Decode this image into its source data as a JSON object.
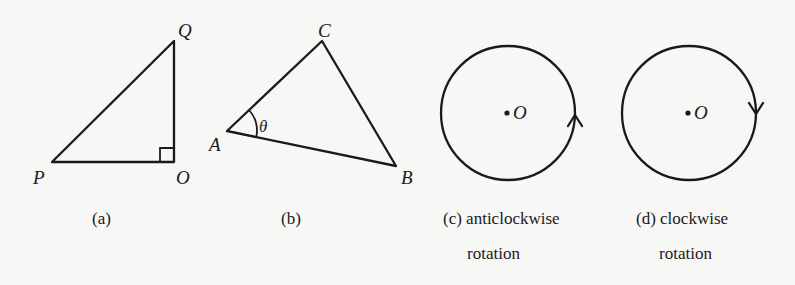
{
  "figure": {
    "panels": [
      {
        "id": "a",
        "caption": "(a)",
        "shape": "right-triangle",
        "vertices": {
          "P": "P",
          "O": "O",
          "Q": "Q"
        },
        "right_angle_at": "O"
      },
      {
        "id": "b",
        "caption": "(b)",
        "shape": "triangle",
        "vertices": {
          "A": "A",
          "B": "B",
          "C": "C"
        },
        "angle_label": "θ",
        "angle_at": "A"
      },
      {
        "id": "c",
        "caption_line1": "(c) anticlockwise",
        "caption_line2": "rotation",
        "shape": "circle",
        "center_label": "O",
        "arrow_direction": "up (anticlockwise)"
      },
      {
        "id": "d",
        "caption_line1": "(d) clockwise",
        "caption_line2": "rotation",
        "shape": "circle",
        "center_label": "O",
        "arrow_direction": "down (clockwise)"
      }
    ],
    "colors": {
      "ink": "#1a1a1a",
      "paper": "#f7f7f5"
    }
  }
}
